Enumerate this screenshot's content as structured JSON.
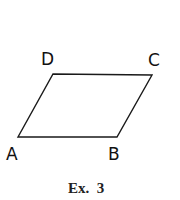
{
  "figure": {
    "shape": "parallelogram",
    "vertices": [
      {
        "label": "A",
        "x": 18,
        "y": 137
      },
      {
        "label": "B",
        "x": 117,
        "y": 137
      },
      {
        "label": "C",
        "x": 152,
        "y": 75
      },
      {
        "label": "D",
        "x": 53,
        "y": 74
      }
    ],
    "labels": {
      "A": "A",
      "B": "B",
      "C": "C",
      "D": "D"
    },
    "caption": "Ex.  3",
    "stroke_color": "#1a1a1a"
  }
}
